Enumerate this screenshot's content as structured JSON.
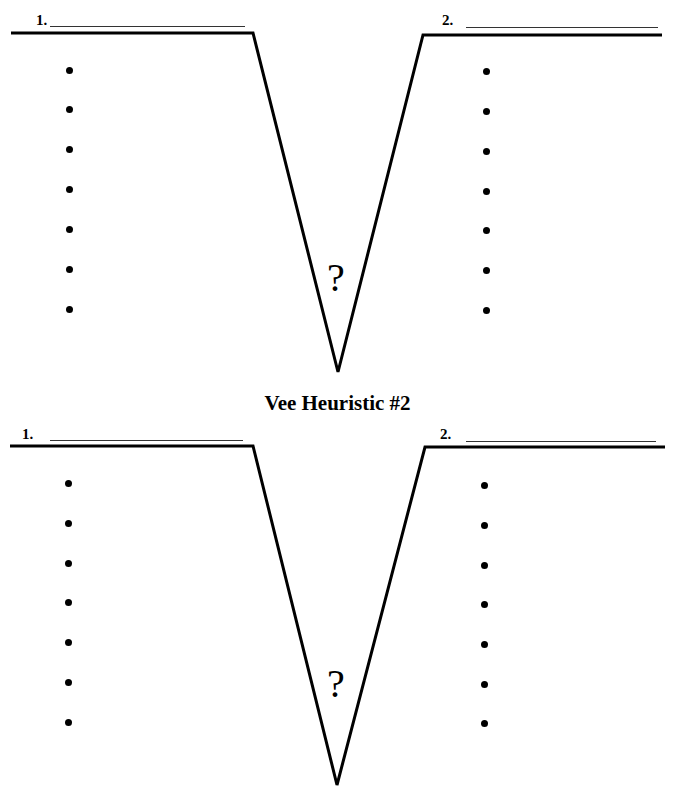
{
  "diagrams": [
    {
      "title": "",
      "left_label": "1.",
      "right_label": "2.",
      "center_symbol": "?",
      "left_bullet_count": 7,
      "right_bullet_count": 7
    },
    {
      "title": "Vee Heuristic #2",
      "left_label": "1.",
      "right_label": "2.",
      "center_symbol": "?",
      "left_bullet_count": 7,
      "right_bullet_count": 7
    }
  ],
  "colors": {
    "ink": "#000000",
    "background": "#ffffff"
  }
}
